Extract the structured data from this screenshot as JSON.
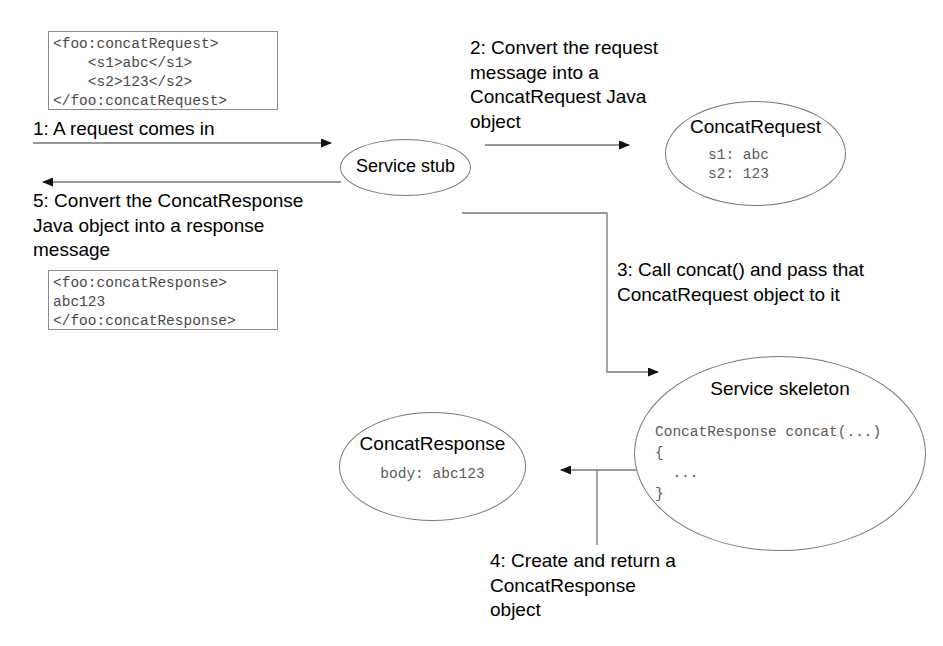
{
  "diagram": {
    "colors": {
      "ink": "#000000",
      "stroke": "#777777",
      "code_text": "#5a5a5a",
      "box_border": "#8c8c8c",
      "background": "#ffffff"
    }
  },
  "xml_blocks": {
    "request": "<foo:concatRequest>\n    <s1>abc</s1>\n    <s2>123</s2>\n</foo:concatRequest>",
    "response": "<foo:concatResponse>\nabc123\n</foo:concatResponse>"
  },
  "steps": [
    {
      "id": 1,
      "text": "1: A request comes in"
    },
    {
      "id": 2,
      "text": "2: Convert the request\nmessage into a\nConcatRequest Java\nobject"
    },
    {
      "id": 3,
      "text": "3: Call concat() and pass that\nConcatRequest object to it"
    },
    {
      "id": 4,
      "text": "4: Create and return a\nConcatResponse\nobject"
    },
    {
      "id": 5,
      "text": "5: Convert the ConcatResponse\nJava object into a response\nmessage"
    }
  ],
  "nodes": {
    "service_stub": {
      "title": "Service stub"
    },
    "concat_request": {
      "title": "ConcatRequest",
      "code": "s1: abc\ns2: 123"
    },
    "concat_response": {
      "title": "ConcatResponse",
      "code": "body: abc123"
    },
    "service_skeleton": {
      "title": "Service skeleton",
      "code": "ConcatResponse concat(...)\n{\n  ...\n}"
    }
  },
  "arrows": [
    {
      "name": "arrow-step-1",
      "direction": "right",
      "label_ref": 1
    },
    {
      "name": "arrow-step-2",
      "direction": "right",
      "label_ref": 2
    },
    {
      "name": "arrow-step-3",
      "direction": "right-elbow-down",
      "label_ref": 3
    },
    {
      "name": "arrow-step-4",
      "direction": "left",
      "label_ref": 4
    },
    {
      "name": "arrow-step-5",
      "direction": "left",
      "label_ref": 5
    }
  ]
}
